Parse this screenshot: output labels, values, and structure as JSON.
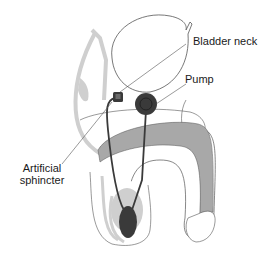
{
  "diagram": {
    "labels": {
      "bladder_neck": "Bladder neck",
      "pump": "Pump",
      "artificial_sphincter_line1": "Artificial",
      "artificial_sphincter_line2": "sphincter"
    },
    "colors": {
      "outline": "#555555",
      "light_gray": "#cfcfcf",
      "mid_gray": "#a8a8a8",
      "device_dark": "#3a3a3a",
      "background": "#ffffff"
    }
  }
}
